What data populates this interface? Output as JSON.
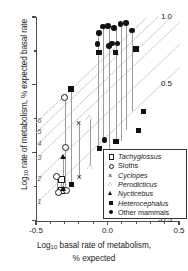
{
  "chart_data": {
    "type": "scatter",
    "title": "",
    "xlabel": "Log10 basal rate of metabolism, % expected",
    "ylabel": "Log10 rate of metabolism, % expected basal rate",
    "xlim": [
      -0.5,
      0.5
    ],
    "ylim": [
      -0.5,
      1.0
    ],
    "xticks": [
      -0.5,
      0.0,
      0.5
    ],
    "xticklabels": [
      "-0.5",
      "0.0",
      "0.5"
    ],
    "yticks": [
      -0.5,
      0.0,
      0.5,
      1.0
    ],
    "yticklabels": [
      "-0.5",
      "0.0",
      "0.5",
      "1.0"
    ],
    "grid": false,
    "legend_position": "lower-right",
    "reference_lines": {
      "style": "dotted",
      "color": "#b4b4b4",
      "slope": 1,
      "labels": [
        "1",
        "2",
        "3",
        "4",
        "5",
        "6"
      ],
      "intercepts": [
        0.13,
        0.3,
        0.46,
        0.56,
        0.65,
        0.73
      ]
    },
    "series": [
      {
        "name": "Tachyglossus",
        "symbol": "open-square",
        "points": [
          {
            "x": -0.325,
            "y": -0.275
          },
          {
            "x": -0.325,
            "y": -0.195
          }
        ]
      },
      {
        "name": "Sloths",
        "symbol": "open-circle",
        "points": [
          {
            "x": -0.355,
            "y": -0.175
          },
          {
            "x": -0.345,
            "y": -0.29
          },
          {
            "x": -0.3,
            "y": 0.405
          },
          {
            "x": -0.295,
            "y": 0.035
          },
          {
            "x": -0.29,
            "y": -0.28
          }
        ]
      },
      {
        "name": "Cyclopes",
        "symbol": "cross",
        "points": [
          {
            "x": -0.2,
            "y": 0.215
          },
          {
            "x": -0.195,
            "y": -0.185
          }
        ]
      },
      {
        "name": "Perodicticus",
        "symbol": "open-triangle",
        "points": [
          {
            "x": -0.125,
            "y": 0.25
          },
          {
            "x": -0.12,
            "y": -0.11
          }
        ]
      },
      {
        "name": "Nycticebus",
        "symbol": "filled-triangle",
        "points": [
          {
            "x": -0.31,
            "y": -0.035
          },
          {
            "x": -0.31,
            "y": -0.27
          }
        ]
      },
      {
        "name": "Heterocephalus",
        "symbol": "filled-square",
        "points": [
          {
            "x": -0.255,
            "y": 0.47
          },
          {
            "x": -0.25,
            "y": -0.235
          },
          {
            "x": -0.06,
            "y": 0.74
          },
          {
            "x": -0.055,
            "y": 0.03
          },
          {
            "x": 0.055,
            "y": 0.74
          },
          {
            "x": 0.06,
            "y": 0.085
          },
          {
            "x": 0.2,
            "y": 0.765
          },
          {
            "x": 0.215,
            "y": 0.165
          },
          {
            "x": 0.25,
            "y": 0.305
          }
        ]
      },
      {
        "name": "Other mammals",
        "symbol": "filled-circle",
        "points": [
          {
            "x": -0.07,
            "y": 0.8
          },
          {
            "x": -0.06,
            "y": 0.88
          },
          {
            "x": -0.03,
            "y": 0.93
          },
          {
            "x": -0.02,
            "y": 0.095
          },
          {
            "x": 0.005,
            "y": 0.935
          },
          {
            "x": 0.01,
            "y": 0.785
          },
          {
            "x": 0.03,
            "y": 0.805
          },
          {
            "x": 0.045,
            "y": 0.92
          },
          {
            "x": 0.07,
            "y": 0.805
          },
          {
            "x": 0.09,
            "y": 0.95
          },
          {
            "x": 0.13,
            "y": 0.955
          },
          {
            "x": 0.17,
            "y": 0.9
          }
        ]
      }
    ],
    "connectors": [
      {
        "x": -0.355,
        "y0": -0.29,
        "y1": -0.175
      },
      {
        "x": -0.325,
        "y0": -0.275,
        "y1": -0.195
      },
      {
        "x": -0.31,
        "y0": -0.27,
        "y1": -0.035
      },
      {
        "x": -0.295,
        "y0": -0.28,
        "y1": 0.035
      },
      {
        "x": -0.3,
        "y0": -0.29,
        "y1": 0.405
      },
      {
        "x": -0.252,
        "y0": -0.235,
        "y1": 0.47
      },
      {
        "x": -0.198,
        "y0": -0.185,
        "y1": 0.215
      },
      {
        "x": -0.122,
        "y0": -0.11,
        "y1": 0.25
      },
      {
        "x": -0.065,
        "y0": 0.03,
        "y1": 0.88
      },
      {
        "x": -0.03,
        "y0": 0.095,
        "y1": 0.93
      },
      {
        "x": 0.007,
        "y0": 0.03,
        "y1": 0.935
      },
      {
        "x": 0.057,
        "y0": 0.085,
        "y1": 0.92
      },
      {
        "x": 0.092,
        "y0": 0.085,
        "y1": 0.95
      },
      {
        "x": 0.132,
        "y0": 0.165,
        "y1": 0.955
      },
      {
        "x": 0.172,
        "y0": 0.305,
        "y1": 0.9
      }
    ]
  },
  "axes": {
    "y_title_main": "Log",
    "y_title_sub": "10",
    "y_title_rest": " rate of metabolism, % expected basal rate",
    "x_title_main": "Log",
    "x_title_sub": "10",
    "x_title_rest": " basal rate of metabolism,",
    "x_title_line2": "% expected"
  },
  "legend": {
    "entries": [
      {
        "label": "Tachyglossus",
        "symbol": "open-square",
        "italic": true
      },
      {
        "label": "Sloths",
        "symbol": "open-circle",
        "italic": false
      },
      {
        "label": "Cyclopes",
        "symbol": "cross",
        "italic": true
      },
      {
        "label": "Perodicticus",
        "symbol": "open-triangle",
        "italic": true
      },
      {
        "label": "Nycticebus",
        "symbol": "filled-triangle",
        "italic": true
      },
      {
        "label": "Heterocephalus",
        "symbol": "filled-square",
        "italic": true
      },
      {
        "label": "Other mammals",
        "symbol": "filled-circle",
        "italic": false
      }
    ],
    "cross_glyph": "×"
  }
}
